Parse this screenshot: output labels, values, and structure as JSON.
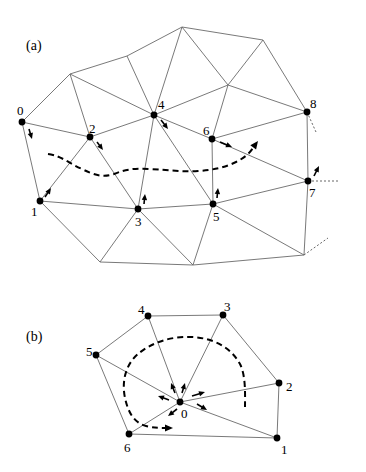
{
  "panels": [
    {
      "id": "a",
      "label": "(a)",
      "label_pos": [
        26,
        50
      ],
      "vertices": {
        "0": [
          22,
          122
        ],
        "1": [
          40,
          201
        ],
        "2": [
          90,
          137
        ],
        "3": [
          138,
          209
        ],
        "4": [
          154,
          115
        ],
        "5": [
          213,
          204
        ],
        "6": [
          212,
          139
        ],
        "7": [
          308,
          181
        ],
        "8": [
          307,
          112
        ],
        "A": [
          70,
          74
        ],
        "B": [
          127,
          56
        ],
        "C": [
          182,
          27
        ],
        "D": [
          263,
          40
        ],
        "E": [
          228,
          85
        ],
        "F": [
          100,
          262
        ],
        "G": [
          193,
          265
        ],
        "H": [
          304,
          255
        ]
      },
      "labeled_nodes": [
        {
          "id": "0",
          "text": "0",
          "lx": 17,
          "ly": 115
        },
        {
          "id": "1",
          "text": "1",
          "lx": 31,
          "ly": 216
        },
        {
          "id": "2",
          "text": "2",
          "lx": 89,
          "ly": 133
        },
        {
          "id": "3",
          "text": "3",
          "lx": 135,
          "ly": 226
        },
        {
          "id": "4",
          "text": "4",
          "lx": 158,
          "ly": 109
        },
        {
          "id": "5",
          "text": "5",
          "lx": 213,
          "ly": 221
        },
        {
          "id": "6",
          "text": "6",
          "lx": 203,
          "ly": 135
        },
        {
          "id": "7",
          "text": "7",
          "lx": 309,
          "ly": 197
        },
        {
          "id": "8",
          "text": "8",
          "lx": 310,
          "ly": 108
        }
      ],
      "edges": [
        [
          "0",
          "A"
        ],
        [
          "A",
          "B"
        ],
        [
          "B",
          "C"
        ],
        [
          "C",
          "D"
        ],
        [
          "D",
          "8"
        ],
        [
          "0",
          "2"
        ],
        [
          "0",
          "1"
        ],
        [
          "A",
          "2"
        ],
        [
          "A",
          "4"
        ],
        [
          "B",
          "4"
        ],
        [
          "C",
          "4"
        ],
        [
          "C",
          "E"
        ],
        [
          "D",
          "E"
        ],
        [
          "E",
          "8"
        ],
        [
          "E",
          "4"
        ],
        [
          "E",
          "6"
        ],
        [
          "2",
          "4"
        ],
        [
          "4",
          "6"
        ],
        [
          "6",
          "8"
        ],
        [
          "2",
          "1"
        ],
        [
          "2",
          "3"
        ],
        [
          "4",
          "3"
        ],
        [
          "4",
          "5"
        ],
        [
          "6",
          "5"
        ],
        [
          "6",
          "7"
        ],
        [
          "8",
          "7"
        ],
        [
          "1",
          "3"
        ],
        [
          "3",
          "5"
        ],
        [
          "5",
          "7"
        ],
        [
          "1",
          "F"
        ],
        [
          "3",
          "F"
        ],
        [
          "3",
          "G"
        ],
        [
          "5",
          "G"
        ],
        [
          "5",
          "H"
        ],
        [
          "7",
          "H"
        ],
        [
          "F",
          "G"
        ],
        [
          "G",
          "H"
        ]
      ],
      "stubs": [
        [
          [
            307,
            112
          ],
          [
            316,
            132
          ]
        ],
        [
          [
            308,
            181
          ],
          [
            339,
            181
          ]
        ],
        [
          [
            304,
            255
          ],
          [
            328,
            238
          ]
        ]
      ],
      "arrows": [
        {
          "from": [
            29,
            129
          ],
          "to": [
            32,
            139
          ]
        },
        {
          "from": [
            97,
            142
          ],
          "to": [
            103,
            150
          ]
        },
        {
          "from": [
            161,
            120
          ],
          "to": [
            168,
            129
          ]
        },
        {
          "from": [
            220,
            142
          ],
          "to": [
            232,
            147
          ]
        },
        {
          "from": [
            45,
            197
          ],
          "to": [
            51,
            188
          ]
        },
        {
          "from": [
            144,
            204
          ],
          "to": [
            145,
            194
          ]
        },
        {
          "from": [
            217,
            198
          ],
          "to": [
            218,
            188
          ]
        },
        {
          "from": [
            314,
            176
          ],
          "to": [
            319,
            166
          ]
        }
      ],
      "dashed_path": "M48,154 C62,156 70,164 82,169 C94,175 103,178 114,174 C126,169 136,168 150,169 C168,170 182,172 198,171 C214,170 226,167 236,162 C244,158 249,154 253,148",
      "dashed_arrow": {
        "tip": [
          258,
          141
        ],
        "dir": [
          0.6,
          -0.8
        ]
      }
    },
    {
      "id": "b",
      "label": "(b)",
      "label_pos": [
        26,
        341
      ],
      "vertices": {
        "0": [
          180,
          402
        ],
        "1": [
          277,
          438
        ],
        "2": [
          279,
          383
        ],
        "3": [
          223,
          315
        ],
        "4": [
          148,
          316
        ],
        "5": [
          96,
          355
        ],
        "6": [
          129,
          434
        ]
      },
      "labeled_nodes": [
        {
          "id": "0",
          "text": "0",
          "lx": 181,
          "ly": 418
        },
        {
          "id": "1",
          "text": "1",
          "lx": 281,
          "ly": 454
        },
        {
          "id": "2",
          "text": "2",
          "lx": 286,
          "ly": 391
        },
        {
          "id": "3",
          "text": "3",
          "lx": 224,
          "ly": 311
        },
        {
          "id": "4",
          "text": "4",
          "lx": 138,
          "ly": 314
        },
        {
          "id": "5",
          "text": "5",
          "lx": 86,
          "ly": 356
        },
        {
          "id": "6",
          "text": "6",
          "lx": 124,
          "ly": 452
        }
      ],
      "edges": [
        [
          "4",
          "3"
        ],
        [
          "3",
          "2"
        ],
        [
          "2",
          "1"
        ],
        [
          "1",
          "6"
        ],
        [
          "6",
          "5"
        ],
        [
          "5",
          "4"
        ],
        [
          "0",
          "1"
        ],
        [
          "0",
          "2"
        ],
        [
          "0",
          "3"
        ],
        [
          "0",
          "4"
        ],
        [
          "0",
          "5"
        ],
        [
          "0",
          "6"
        ]
      ],
      "stubs": [],
      "arrows": [
        {
          "from": [
            175,
            393
          ],
          "to": [
            171,
            383
          ]
        },
        {
          "from": [
            182,
            393
          ],
          "to": [
            185,
            383
          ]
        },
        {
          "from": [
            169,
            400
          ],
          "to": [
            158,
            396
          ]
        },
        {
          "from": [
            192,
            396
          ],
          "to": [
            205,
            392
          ]
        },
        {
          "from": [
            197,
            404
          ],
          "to": [
            207,
            410
          ]
        },
        {
          "from": [
            177,
            409
          ],
          "to": [
            168,
            416
          ]
        }
      ],
      "dashed_path": "M245,407 C245,395 246,376 240,364 C230,346 212,338 192,337 C168,336 150,344 138,354 C124,366 122,384 125,398 C128,412 134,423 146,426 C154,428 160,428 166,428",
      "dashed_arrow": {
        "tip": [
          173,
          428
        ],
        "dir": [
          1,
          0
        ]
      }
    }
  ]
}
